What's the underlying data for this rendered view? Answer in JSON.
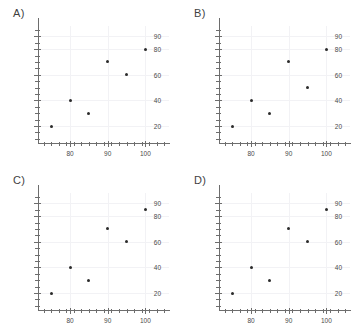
{
  "figure": {
    "background_color": "#ffffff",
    "point_color": "#2b2b2b",
    "axis_color": "#6d6d6d",
    "grid_color": "#f2f2f5"
  },
  "panels": [
    {
      "label": "A)",
      "chart_data": {
        "type": "scatter",
        "title": "A)",
        "xlabel": "",
        "ylabel": "",
        "x": [
          75,
          80,
          85,
          90,
          95,
          100
        ],
        "y": [
          20,
          40,
          30,
          70,
          60,
          80
        ],
        "points": [
          {
            "x": 75,
            "y": 20
          },
          {
            "x": 80,
            "y": 40
          },
          {
            "x": 85,
            "y": 30
          },
          {
            "x": 90,
            "y": 70
          },
          {
            "x": 95,
            "y": 60
          },
          {
            "x": 100,
            "y": 80
          }
        ],
        "xlim": [
          71.5,
          106
        ],
        "ylim": [
          6,
          98
        ],
        "xticks_labeled": [
          80,
          90,
          100
        ],
        "yticks_labeled": [
          20,
          40,
          60,
          80,
          90
        ],
        "xtick_labels": [
          "80",
          "90",
          "100"
        ],
        "ytick_labels": [
          "20",
          "40",
          "60",
          "80",
          "90"
        ],
        "xticks_minor": [
          73,
          75,
          77,
          79,
          81,
          83,
          85,
          87,
          89,
          91,
          93,
          95,
          97,
          99,
          101,
          103,
          105
        ],
        "yticks_minor": [
          10,
          15,
          25,
          30,
          35,
          45,
          50,
          55,
          65,
          70,
          75,
          85,
          95
        ],
        "grid": true,
        "legend": "none"
      }
    },
    {
      "label": "B)",
      "chart_data": {
        "type": "scatter",
        "title": "B)",
        "xlabel": "",
        "ylabel": "",
        "x": [
          75,
          80,
          85,
          90,
          95,
          100
        ],
        "y": [
          20,
          40,
          30,
          70,
          50,
          80
        ],
        "points": [
          {
            "x": 75,
            "y": 20
          },
          {
            "x": 80,
            "y": 40
          },
          {
            "x": 85,
            "y": 30
          },
          {
            "x": 90,
            "y": 70
          },
          {
            "x": 95,
            "y": 50
          },
          {
            "x": 100,
            "y": 80
          }
        ],
        "xlim": [
          71.5,
          106
        ],
        "ylim": [
          6,
          98
        ],
        "xticks_labeled": [
          80,
          90,
          100
        ],
        "yticks_labeled": [
          20,
          40,
          60,
          80,
          90
        ],
        "xtick_labels": [
          "80",
          "90",
          "100"
        ],
        "ytick_labels": [
          "20",
          "40",
          "60",
          "80",
          "90"
        ],
        "xticks_minor": [
          73,
          75,
          77,
          79,
          81,
          83,
          85,
          87,
          89,
          91,
          93,
          95,
          97,
          99,
          101,
          103,
          105
        ],
        "yticks_minor": [
          10,
          15,
          25,
          30,
          35,
          45,
          50,
          55,
          65,
          70,
          75,
          85,
          95
        ],
        "grid": true,
        "legend": "none"
      }
    },
    {
      "label": "C)",
      "chart_data": {
        "type": "scatter",
        "title": "C)",
        "xlabel": "",
        "ylabel": "",
        "x": [
          75,
          80,
          85,
          90,
          95,
          100
        ],
        "y": [
          20,
          40,
          30,
          70,
          60,
          85
        ],
        "points": [
          {
            "x": 75,
            "y": 20
          },
          {
            "x": 80,
            "y": 40
          },
          {
            "x": 85,
            "y": 30
          },
          {
            "x": 90,
            "y": 70
          },
          {
            "x": 95,
            "y": 60
          },
          {
            "x": 100,
            "y": 85
          }
        ],
        "xlim": [
          71.5,
          106
        ],
        "ylim": [
          6,
          98
        ],
        "xticks_labeled": [
          80,
          90,
          100
        ],
        "yticks_labeled": [
          20,
          40,
          60,
          80,
          90
        ],
        "xtick_labels": [
          "80",
          "90",
          "100"
        ],
        "ytick_labels": [
          "20",
          "40",
          "60",
          "80",
          "90"
        ],
        "xticks_minor": [
          73,
          75,
          77,
          79,
          81,
          83,
          85,
          87,
          89,
          91,
          93,
          95,
          97,
          99,
          101,
          103,
          105
        ],
        "yticks_minor": [
          10,
          15,
          25,
          30,
          35,
          45,
          50,
          55,
          65,
          70,
          75,
          85,
          95
        ],
        "grid": true,
        "legend": "none"
      }
    },
    {
      "label": "D)",
      "chart_data": {
        "type": "scatter",
        "title": "D)",
        "xlabel": "",
        "ylabel": "",
        "x": [
          75,
          80,
          85,
          90,
          95,
          100
        ],
        "y": [
          20,
          40,
          30,
          70,
          60,
          85
        ],
        "points": [
          {
            "x": 75,
            "y": 20
          },
          {
            "x": 80,
            "y": 40
          },
          {
            "x": 85,
            "y": 30
          },
          {
            "x": 90,
            "y": 70
          },
          {
            "x": 95,
            "y": 60
          },
          {
            "x": 100,
            "y": 85
          }
        ],
        "xlim": [
          71.5,
          106
        ],
        "ylim": [
          6,
          98
        ],
        "xticks_labeled": [
          80,
          90,
          100
        ],
        "yticks_labeled": [
          20,
          40,
          60,
          80,
          90
        ],
        "xtick_labels": [
          "80",
          "90",
          "100"
        ],
        "ytick_labels": [
          "20",
          "40",
          "60",
          "80",
          "90"
        ],
        "xticks_minor": [
          73,
          75,
          77,
          79,
          81,
          83,
          85,
          87,
          89,
          91,
          93,
          95,
          97,
          99,
          101,
          103,
          105
        ],
        "yticks_minor": [
          10,
          15,
          25,
          30,
          35,
          45,
          50,
          55,
          65,
          70,
          75,
          85,
          95
        ],
        "grid": true,
        "legend": "none"
      }
    }
  ]
}
